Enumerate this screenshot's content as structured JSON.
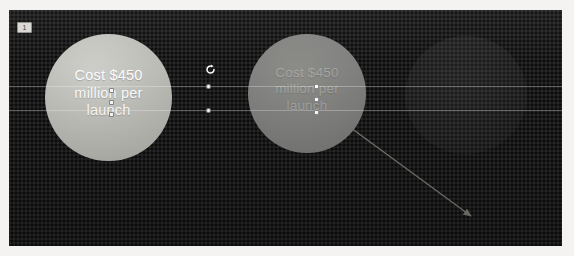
{
  "canvas": {
    "background_color": "#1b1b1b",
    "slide_badge_label": "1"
  },
  "shapes": {
    "primary": {
      "name": "cost-ellipse",
      "text": "Cost $450\nmillion per\nlaunch",
      "fill_color": "#bdbdb8",
      "text_color": "#ffffff"
    },
    "secondary": {
      "name": "cost-ellipse-ghost",
      "text": "Cost $450\nmillion per\nlaunch",
      "fill_color": "#818180",
      "text_color": "#6f6f6e"
    },
    "tertiary": {
      "name": "faded-ellipse",
      "text": "",
      "fill_color": "#2c2c2c"
    }
  },
  "selection": {
    "rotate_handle_label": "rotate-handle",
    "handle_color": "#ffffff",
    "guide_color": "#4d4d4d"
  },
  "connector": {
    "label": "drag-arrow",
    "color": "#6d6d6a",
    "start_x": 342,
    "start_y": 118,
    "end_x": 464,
    "end_y": 208
  }
}
